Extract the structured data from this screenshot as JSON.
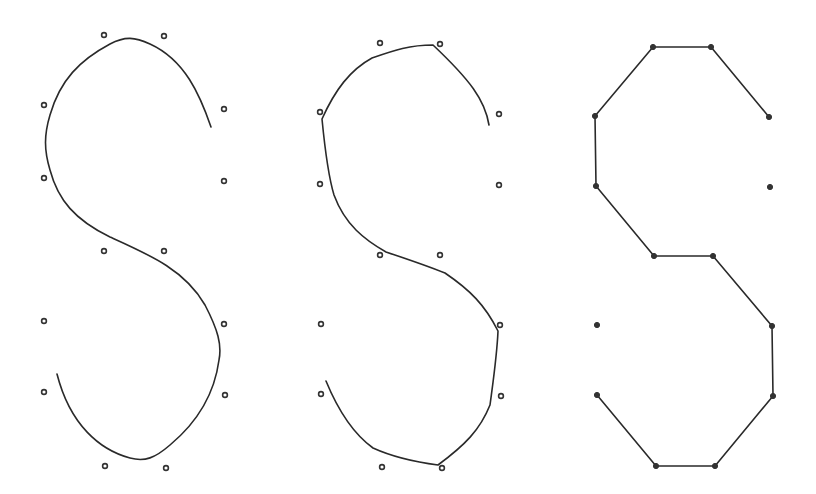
{
  "figure": {
    "panels": [
      {
        "id": "spline-approximating",
        "curve_type": "approximating spline",
        "points": [
          [
            104,
            35
          ],
          [
            164,
            36
          ],
          [
            44,
            105
          ],
          [
            224,
            109
          ],
          [
            44,
            178
          ],
          [
            224,
            181
          ],
          [
            104,
            251
          ],
          [
            164,
            251
          ],
          [
            44,
            321
          ],
          [
            224,
            324
          ],
          [
            44,
            392
          ],
          [
            225,
            395
          ],
          [
            105,
            466
          ],
          [
            166,
            468
          ]
        ],
        "path": "M 211 127 C 200 95, 185 60, 150 44 C 135 37, 125 36, 110 44 C 80 60, 60 80, 50 115 C 44 135, 44 150, 50 170 C 58 200, 75 220, 110 237 C 150 255, 185 270, 205 305 C 218 330, 222 345, 219 360 C 215 390, 200 420, 170 445 C 155 458, 145 462, 130 458 C 100 450, 70 425, 57 374"
      },
      {
        "id": "spline-interpolating",
        "curve_type": "interpolating spline",
        "points": [
          [
            380,
            43
          ],
          [
            440,
            44
          ],
          [
            320,
            112
          ],
          [
            499,
            114
          ],
          [
            320,
            184
          ],
          [
            499,
            185
          ],
          [
            380,
            255
          ],
          [
            440,
            255
          ],
          [
            321,
            324
          ],
          [
            500,
            325
          ],
          [
            321,
            394
          ],
          [
            501,
            396
          ],
          [
            382,
            467
          ],
          [
            442,
            468
          ]
        ],
        "path": "M 489 125 C 485 100, 470 80, 433 45 C 410 45, 395 50, 372 58 C 350 70, 335 90, 322 119 C 325 150, 328 175, 334 195 C 345 225, 365 240, 386 252 C 410 260, 425 265, 445 273 C 470 290, 485 305, 498 331 C 497 355, 494 375, 490 405 C 480 430, 465 445, 438 465 C 415 462, 395 458, 373 448 C 355 435, 340 415, 326 381"
      },
      {
        "id": "polyline",
        "curve_type": "polyline",
        "points": [
          [
            653,
            47
          ],
          [
            711,
            47
          ],
          [
            595,
            116
          ],
          [
            769,
            117
          ],
          [
            596,
            186
          ],
          [
            770,
            187
          ],
          [
            654,
            256
          ],
          [
            713,
            256
          ],
          [
            597,
            325
          ],
          [
            772,
            326
          ],
          [
            597,
            395
          ],
          [
            773,
            396
          ],
          [
            656,
            466
          ],
          [
            715,
            466
          ]
        ],
        "polyline": [
          [
            769,
            117
          ],
          [
            711,
            47
          ],
          [
            653,
            47
          ],
          [
            595,
            116
          ],
          [
            596,
            186
          ],
          [
            654,
            256
          ],
          [
            713,
            256
          ],
          [
            772,
            326
          ],
          [
            773,
            396
          ],
          [
            715,
            466
          ],
          [
            656,
            466
          ],
          [
            597,
            395
          ]
        ]
      }
    ],
    "colors": {
      "stroke": "#2a2a2a",
      "point": "#333333",
      "background": "#ffffff"
    }
  }
}
